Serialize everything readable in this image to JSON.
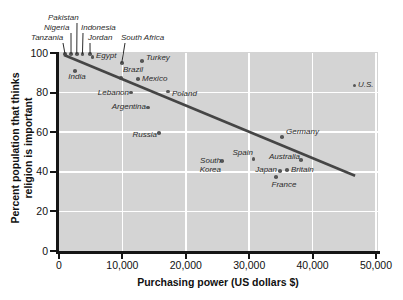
{
  "colors": {
    "plot_background": "#d4d4d4",
    "gridline": "#ffffff",
    "axis": "#151515",
    "point": "#565656",
    "trend_line": "#454545",
    "label_text": "#2b2b2b"
  },
  "figure": {
    "x_axis_title": "Purchasing power (US dollars $)",
    "y_axis_title_line1": "Percent population that thinks",
    "y_axis_title_line2": "religion is important"
  },
  "chart_data": {
    "type": "scatter",
    "xlabel": "Purchasing power (US dollars $)",
    "ylabel": "Percent population that thinks religion is important",
    "xlim": [
      0,
      50000
    ],
    "ylim": [
      0,
      100
    ],
    "grid": true,
    "x_ticks": [
      {
        "v": 0,
        "label": "0"
      },
      {
        "v": 10000,
        "label": "10,000"
      },
      {
        "v": 20000,
        "label": "20,000"
      },
      {
        "v": 30000,
        "label": "30,000"
      },
      {
        "v": 40000,
        "label": "40,000"
      },
      {
        "v": 50000,
        "label": "50,000"
      }
    ],
    "y_ticks": [
      {
        "v": 0,
        "label": "0"
      },
      {
        "v": 20,
        "label": "20"
      },
      {
        "v": 40,
        "label": "40"
      },
      {
        "v": 60,
        "label": "60"
      },
      {
        "v": 80,
        "label": "80"
      },
      {
        "v": 100,
        "label": "100"
      }
    ],
    "trend_line": {
      "x1_usd": 800,
      "y1_pct": 99,
      "x2_usd": 46700,
      "y2_pct": 38
    },
    "points": [
      {
        "name": "Tanzania",
        "usd": 950,
        "pct": 99.5,
        "align": "l",
        "lx": 31,
        "ly": 34,
        "leader": [
          63,
          43
        ]
      },
      {
        "name": "Nigeria",
        "usd": 1900,
        "pct": 99.5,
        "align": "l",
        "lx": 44,
        "ly": 24,
        "leader": [
          71,
          33
        ]
      },
      {
        "name": "Pakistan",
        "usd": 2800,
        "pct": 99.5,
        "align": "l",
        "lx": 48,
        "ly": 14,
        "leader": [
          77,
          23
        ]
      },
      {
        "name": "Indonesia",
        "usd": 3700,
        "pct": 99.5,
        "align": "l",
        "lx": 81,
        "ly": 24,
        "leader": [
          83,
          33
        ]
      },
      {
        "name": "Jordan",
        "usd": 4900,
        "pct": 99.5,
        "align": "l",
        "lx": 88,
        "ly": 34,
        "leader": [
          90,
          43
        ]
      },
      {
        "name": "South Africa",
        "usd": 9900,
        "pct": 95,
        "align": "l",
        "lx": 121,
        "ly": 34,
        "leader": [
          125,
          43
        ]
      },
      {
        "name": "Egypt",
        "usd": 5300,
        "pct": 98,
        "align": "l",
        "lx": 96,
        "ly": 52
      },
      {
        "name": "India",
        "usd": 2500,
        "pct": 91,
        "align": "c",
        "lx": 77,
        "ly": 73
      },
      {
        "name": "Turkey",
        "usd": 13100,
        "pct": 96,
        "align": "l",
        "lx": 146,
        "ly": 54
      },
      {
        "name": "Brazil",
        "usd": 9800,
        "pct": 87.5,
        "align": "l",
        "lx": 123,
        "ly": 66
      },
      {
        "name": "Mexico",
        "usd": 12500,
        "pct": 87,
        "align": "l",
        "lx": 142,
        "ly": 75
      },
      {
        "name": "Lebanon",
        "usd": 11400,
        "pct": 80,
        "align": "r",
        "lx": 129,
        "ly": 89
      },
      {
        "name": "Poland",
        "usd": 17200,
        "pct": 80.5,
        "align": "l",
        "lx": 172,
        "ly": 90
      },
      {
        "name": "Argentina",
        "usd": 14000,
        "pct": 72.5,
        "align": "r",
        "lx": 146,
        "ly": 103
      },
      {
        "name": "Russia",
        "usd": 15800,
        "pct": 59.5,
        "align": "r",
        "lx": 157,
        "ly": 131
      },
      {
        "name": "South\nKorea",
        "usd": 25700,
        "pct": 45.5,
        "align": "r",
        "lx": 221,
        "ly": 157
      },
      {
        "name": "Spain",
        "usd": 30700,
        "pct": 46.5,
        "align": "r",
        "lx": 253,
        "ly": 149
      },
      {
        "name": "Australia",
        "usd": 38200,
        "pct": 46,
        "align": "r",
        "lx": 300,
        "ly": 153
      },
      {
        "name": "Japan",
        "usd": 34900,
        "pct": 40.5,
        "align": "r",
        "lx": 277,
        "ly": 166
      },
      {
        "name": "Britain",
        "usd": 36000,
        "pct": 41,
        "align": "l",
        "lx": 291,
        "ly": 166
      },
      {
        "name": "France",
        "usd": 34200,
        "pct": 37.5,
        "align": "c",
        "lx": 284,
        "ly": 181
      },
      {
        "name": "Germany",
        "usd": 35200,
        "pct": 57.5,
        "align": "l",
        "lx": 286,
        "ly": 128
      },
      {
        "name": "U.S.",
        "usd": 46600,
        "pct": 83.5,
        "align": "l",
        "lx": 358,
        "ly": 81
      }
    ]
  }
}
